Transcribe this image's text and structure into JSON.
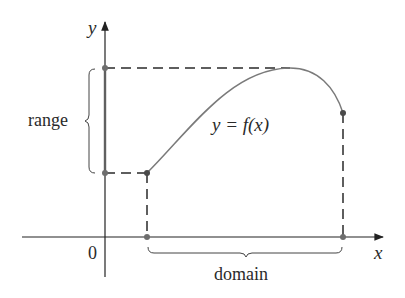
{
  "diagram": {
    "type": "function-domain-range",
    "axes": {
      "x_label": "x",
      "y_label": "y",
      "origin_label": "0"
    },
    "function_label": "y = f(x)",
    "range_label": "range",
    "domain_label": "domain",
    "colors": {
      "axis": "#222222",
      "curve": "#7a7a7a",
      "dashes": "#2a2a2a",
      "dots": "#6e6e6e",
      "brace": "#444444",
      "y_axis_highlight": "#bdbdbd"
    }
  }
}
